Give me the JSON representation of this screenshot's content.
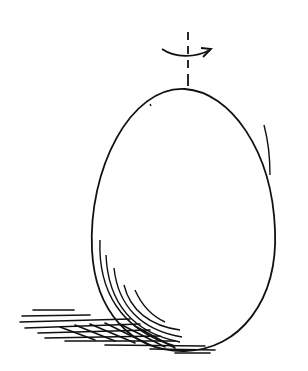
{
  "illustration": {
    "subject": "egg",
    "description": "Line drawing of an upright egg resting on a shadowed surface, with a vertical dashed rotation axis and curved arrow at the top",
    "ink_color": "#111111",
    "background": "#ffffff"
  }
}
